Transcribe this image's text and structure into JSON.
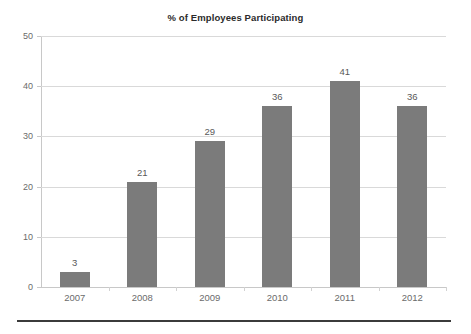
{
  "chart_data": {
    "type": "bar",
    "title": "% of Employees Participating",
    "xlabel": "",
    "ylabel": "",
    "categories": [
      "2007",
      "2008",
      "2009",
      "2010",
      "2011",
      "2012"
    ],
    "values": [
      3,
      21,
      29,
      36,
      41,
      36
    ],
    "series": [
      {
        "name": "% of Employees Participating",
        "values": [
          3,
          21,
          29,
          36,
          41,
          36
        ]
      }
    ],
    "ylim": [
      0,
      50
    ],
    "yticks": [
      0,
      10,
      20,
      30,
      40,
      50
    ],
    "ytick_labels": [
      "0",
      "10",
      "20",
      "30",
      "40",
      "50"
    ],
    "grid": true,
    "grid_axis": "y",
    "legend": false,
    "legend_position": "none",
    "data_labels": [
      "3",
      "21",
      "29",
      "36",
      "41",
      "36"
    ],
    "colors": {
      "bar": "#7b7b7b",
      "gridline": "#d9d9d9",
      "axis": "#c8c8c8",
      "title_text": "#2b2b2b",
      "tick_text": "#6b6b6b",
      "label_text": "#595959",
      "background": "#ffffff",
      "bottom_rule": "#3b3b3b"
    }
  }
}
